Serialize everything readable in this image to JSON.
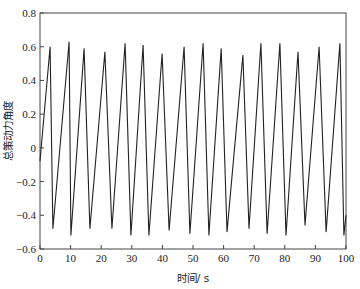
{
  "chart_data": {
    "type": "line",
    "title": "",
    "xlabel": "时间/ s",
    "ylabel": "总策动力角度",
    "xlim": [
      0,
      100
    ],
    "ylim": [
      -0.6,
      0.8
    ],
    "xticks": [
      0,
      10,
      20,
      30,
      40,
      50,
      60,
      70,
      80,
      90,
      100
    ],
    "yticks": [
      -0.6,
      -0.4,
      -0.2,
      0,
      0.2,
      0.4,
      0.6,
      0.8
    ],
    "xtick_labels": [
      "0",
      "10",
      "20",
      "30",
      "40",
      "50",
      "60",
      "70",
      "80",
      "90",
      "100"
    ],
    "ytick_labels": [
      "−0.6",
      "−0.4",
      "−0.2",
      "0",
      "0.2",
      "0.4",
      "0.6",
      "0.8"
    ],
    "grid": false,
    "legend": null,
    "series": [
      {
        "name": "总策动力角度",
        "color": "#222222",
        "x": [
          0,
          3.3,
          4.2,
          9.5,
          10.1,
          14.4,
          16.3,
          21.2,
          23.5,
          27.8,
          29.7,
          33.7,
          35.6,
          39.9,
          42.2,
          47.1,
          49.0,
          53.3,
          55.2,
          59.2,
          61.1,
          66.3,
          68.3,
          72.2,
          74.2,
          78.4,
          80.4,
          84.3,
          86.6,
          91.2,
          93.5,
          98.0,
          99.3,
          100
        ],
        "y": [
          -0.08,
          0.6,
          -0.48,
          0.63,
          -0.52,
          0.59,
          -0.48,
          0.57,
          -0.48,
          0.62,
          -0.52,
          0.61,
          -0.52,
          0.56,
          -0.49,
          0.6,
          -0.51,
          0.62,
          -0.52,
          0.59,
          -0.5,
          0.55,
          -0.48,
          0.62,
          -0.51,
          0.62,
          -0.52,
          0.57,
          -0.46,
          0.6,
          -0.5,
          0.62,
          -0.52,
          -0.4
        ]
      }
    ]
  },
  "layout": {
    "plot_left": 40,
    "plot_right": 346,
    "plot_top": 13,
    "plot_bottom": 249,
    "axis_color": "#444444"
  }
}
